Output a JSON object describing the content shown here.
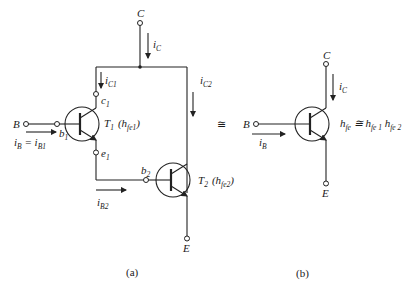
{
  "figure_a": {
    "caption": "(a)",
    "terminals": {
      "collector": "C",
      "base": "B",
      "emitter": "E"
    },
    "currents": {
      "ic": "i",
      "ic_sub": "C",
      "ic1": "i",
      "ic1_sub": "C1",
      "ic2": "i",
      "ic2_sub": "C2",
      "ib": "i",
      "ib_sub": "B",
      "ib_eq": " = i",
      "ib1_sub": "B1",
      "ib2": "i",
      "ib2_sub": "B2"
    },
    "nodes": {
      "c1": "c",
      "c1_sub": "1",
      "b1": "b",
      "b1_sub": "1",
      "e1": "e",
      "e1_sub": "1",
      "b2": "b",
      "b2_sub": "2"
    },
    "transistors": [
      {
        "name": "T",
        "name_sub": "1",
        "param": "(h",
        "param_sub": "fe1",
        "close": ")"
      },
      {
        "name": "T",
        "name_sub": "2",
        "param": "(h",
        "param_sub": "fe2",
        "close": ")"
      }
    ]
  },
  "equivalence_symbol": "≅",
  "figure_b": {
    "caption": "(b)",
    "terminals": {
      "collector": "C",
      "base": "B",
      "emitter": "E"
    },
    "currents": {
      "ic": "i",
      "ic_sub": "C",
      "ib": "i",
      "ib_sub": "B"
    },
    "formula": {
      "lhs": "h",
      "lhs_sub": "fe",
      "eq": " ≅ h",
      "r1_sub": "fe 1",
      "mid": " h",
      "r2_sub": "fe 2"
    }
  }
}
